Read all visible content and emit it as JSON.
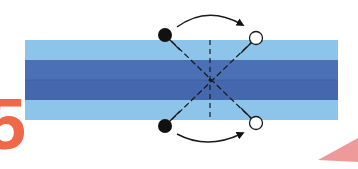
{
  "diagram": {
    "step_number": "5",
    "colors": {
      "background": "#ffffff",
      "strip_light": "#8cc4ea",
      "strip_dark": "#4b70b6",
      "strip_dark_fold": "#4467ad",
      "line": "#1a1a1a",
      "dot_filled": "#111111",
      "dot_open": "#ffffff",
      "step_number": "#f0684a",
      "corner_triangle": "#ee9a9a"
    },
    "strip": {
      "x": 25,
      "y": 40,
      "width": 313,
      "height": 80,
      "bands": [
        {
          "name": "top-light-band",
          "y": 40,
          "height": 20
        },
        {
          "name": "dark-band",
          "y": 60,
          "height": 40
        },
        {
          "name": "bottom-light-band",
          "y": 100,
          "height": 20
        }
      ],
      "fold_line_y": 80
    },
    "markers": {
      "top_filled": {
        "cx": 165,
        "cy": 35
      },
      "top_open": {
        "cx": 256,
        "cy": 38
      },
      "bottom_filled": {
        "cx": 165,
        "cy": 126
      },
      "bottom_open": {
        "cx": 256,
        "cy": 123
      }
    },
    "crease": {
      "x": 210,
      "y1": 40,
      "y2": 120,
      "style": "dashed"
    },
    "arrows": [
      {
        "name": "top-arrow",
        "from": "top_filled",
        "to": "top_open",
        "direction": "right"
      },
      {
        "name": "bottom-arrow",
        "from": "bottom_filled",
        "to": "bottom_open",
        "direction": "right"
      }
    ],
    "corner_shape": "triangle"
  }
}
